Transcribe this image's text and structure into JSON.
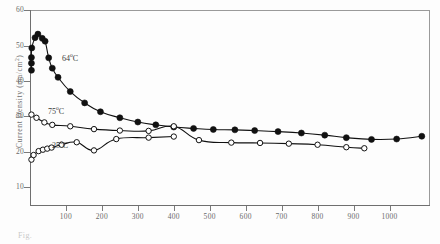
{
  "figure": {
    "caption": "Fig.",
    "axis": {
      "y_title_text": "Current Density (ma/cm",
      "y_title_sup": "2",
      "y_title_tail": ")",
      "y_ticks": [
        60,
        50,
        40,
        30,
        20,
        10
      ],
      "x_ticks": [
        100,
        200,
        300,
        400,
        500,
        600,
        700,
        800,
        900,
        1000
      ]
    },
    "annotations": [
      {
        "name": "annot-64",
        "value": "64",
        "sup": "o",
        "unit": "C"
      },
      {
        "name": "annot-75",
        "value": "75",
        "sup": "o",
        "unit": "C"
      },
      {
        "name": "annot-25",
        "value": "25",
        "sup": "o",
        "unit": "C"
      }
    ]
  },
  "chart_data": {
    "type": "line",
    "title": "",
    "xlabel": "",
    "ylabel": "Current Density (ma/cm2)",
    "xlim": [
      0,
      1110
    ],
    "ylim": [
      5,
      60
    ],
    "grid": false,
    "legend": "annotated-inline",
    "series": [
      {
        "name": "64 C",
        "marker": "filled-circle",
        "color": "#111111",
        "points": [
          [
            4,
            43.0
          ],
          [
            4,
            45.0
          ],
          [
            4,
            46.6
          ],
          [
            5,
            49.3
          ],
          [
            14,
            52.2
          ],
          [
            22,
            53.2
          ],
          [
            34,
            52.0
          ],
          [
            42,
            51.2
          ],
          [
            52,
            46.5
          ],
          [
            62,
            43.6
          ],
          [
            78,
            41.0
          ],
          [
            112,
            37.0
          ],
          [
            152,
            33.8
          ],
          [
            196,
            31.3
          ],
          [
            250,
            29.6
          ],
          [
            300,
            28.4
          ],
          [
            350,
            27.6
          ],
          [
            400,
            27.0
          ],
          [
            455,
            26.6
          ],
          [
            510,
            26.3
          ],
          [
            570,
            26.2
          ],
          [
            625,
            26.0
          ],
          [
            690,
            25.7
          ],
          [
            755,
            25.3
          ],
          [
            820,
            24.7
          ],
          [
            880,
            24.0
          ],
          [
            950,
            23.5
          ],
          [
            1020,
            23.6
          ],
          [
            1090,
            24.4
          ]
        ]
      },
      {
        "name": "75 C",
        "marker": "open-circle",
        "color": "#111111",
        "points": [
          [
            4,
            30.5
          ],
          [
            18,
            29.6
          ],
          [
            40,
            28.3
          ],
          [
            62,
            27.6
          ],
          [
            112,
            27.2
          ],
          [
            178,
            26.4
          ],
          [
            250,
            26.0
          ],
          [
            330,
            25.9
          ],
          [
            400,
            27.2
          ],
          [
            470,
            23.3
          ],
          [
            560,
            22.6
          ],
          [
            640,
            22.5
          ],
          [
            720,
            22.3
          ],
          [
            800,
            22.0
          ],
          [
            880,
            21.3
          ],
          [
            930,
            21.0
          ]
        ]
      },
      {
        "name": "25 C",
        "marker": "open-circle",
        "color": "#111111",
        "points": [
          [
            4,
            17.8
          ],
          [
            10,
            19.1
          ],
          [
            24,
            20.2
          ],
          [
            36,
            20.6
          ],
          [
            48,
            20.9
          ],
          [
            60,
            21.2
          ],
          [
            88,
            22.0
          ],
          [
            130,
            22.7
          ],
          [
            178,
            20.4
          ],
          [
            240,
            23.6
          ],
          [
            330,
            24.0
          ],
          [
            400,
            24.3
          ]
        ]
      }
    ]
  }
}
